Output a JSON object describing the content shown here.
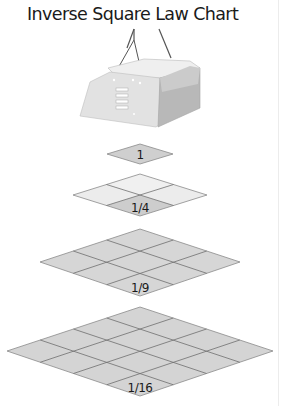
{
  "title": "Inverse Square Law Chart",
  "colors": {
    "tile_light": "#ececec",
    "tile_mid": "#d4d4d4",
    "tile_dark": "#cfcfcf",
    "grid_line": "#707070",
    "lamp_body": "#dcdcdc"
  },
  "lamp": {
    "label": "lamp-fixture"
  },
  "levels": [
    {
      "label": "1",
      "grid": 1,
      "cx": 140,
      "cy": 154,
      "hw": 33,
      "hh": 10
    },
    {
      "label": "1/4",
      "grid": 2,
      "cx": 140,
      "cy": 195,
      "hw": 67,
      "hh": 21
    },
    {
      "label": "1/9",
      "grid": 3,
      "cx": 140,
      "cy": 262,
      "hw": 100,
      "hh": 33
    },
    {
      "label": "1/16",
      "grid": 4,
      "cx": 140,
      "cy": 351,
      "hw": 133,
      "hh": 44
    }
  ]
}
